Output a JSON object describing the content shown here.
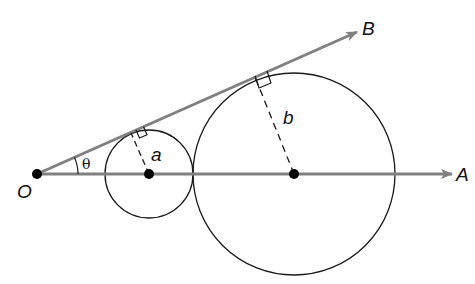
{
  "diagram": {
    "labels": {
      "origin": "O",
      "ray_a": "A",
      "ray_b": "B",
      "angle": "θ",
      "small_radius": "a",
      "large_radius": "b"
    },
    "colors": {
      "ray": "#808080",
      "circle": "#1a1a1a",
      "point": "#000000"
    }
  }
}
